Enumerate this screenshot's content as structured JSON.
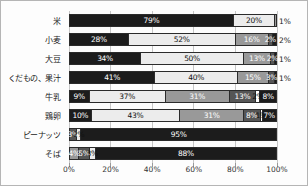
{
  "chart_data": {
    "type": "bar",
    "orientation": "horizontal-stacked",
    "title": "",
    "xlabel": "",
    "ylabel": "",
    "xlim": [
      0,
      100
    ],
    "grid": true,
    "x_ticks": [
      "0%",
      "20%",
      "40%",
      "60%",
      "80%",
      "100%"
    ],
    "categories": [
      "米",
      "小麦",
      "大豆",
      "くだもの、果汁",
      "牛乳",
      "鶏卵",
      "ピーナッツ",
      "そば"
    ],
    "colors": {
      "black": "#1c1c1c",
      "light": "#ececec",
      "gray": "#999999",
      "darkgray": "#555555",
      "white": "#ffffff",
      "text_dark": "#111111",
      "text_light": "#ffffff",
      "grid": "#c6c6c6",
      "border": "#2b2b2b"
    },
    "rows": [
      {
        "category": "米",
        "segments": [
          {
            "value": 79,
            "label": "79%",
            "color": "black"
          },
          {
            "value": 20,
            "label": "20%",
            "color": "light"
          },
          {
            "value": 1,
            "label": "",
            "color": "gray"
          }
        ],
        "outside_label": "1%"
      },
      {
        "category": "小麦",
        "segments": [
          {
            "value": 28,
            "label": "28%",
            "color": "black"
          },
          {
            "value": 52,
            "label": "52%",
            "color": "light"
          },
          {
            "value": 16,
            "label": "16%",
            "color": "gray"
          },
          {
            "value": 2,
            "label": "2%",
            "color": "darkgray"
          },
          {
            "value": 2,
            "label": "",
            "color": "black"
          }
        ],
        "outside_label": "2%"
      },
      {
        "category": "大豆",
        "segments": [
          {
            "value": 34,
            "label": "34%",
            "color": "black"
          },
          {
            "value": 50,
            "label": "50%",
            "color": "light"
          },
          {
            "value": 13,
            "label": "13%",
            "color": "gray"
          },
          {
            "value": 2,
            "label": "2%",
            "color": "darkgray"
          },
          {
            "value": 1,
            "label": "",
            "color": "black"
          }
        ],
        "outside_label": "1%"
      },
      {
        "category": "くだもの、果汁",
        "segments": [
          {
            "value": 41,
            "label": "41%",
            "color": "black"
          },
          {
            "value": 40,
            "label": "40%",
            "color": "light"
          },
          {
            "value": 15,
            "label": "15%",
            "color": "gray"
          },
          {
            "value": 3,
            "label": "3%",
            "color": "darkgray"
          },
          {
            "value": 1,
            "label": "",
            "color": "black"
          }
        ],
        "outside_label": "1%"
      },
      {
        "category": "牛乳",
        "segments": [
          {
            "value": 9,
            "label": "9%",
            "color": "black"
          },
          {
            "value": 37,
            "label": "37%",
            "color": "light"
          },
          {
            "value": 31,
            "label": "31%",
            "color": "gray"
          },
          {
            "value": 13,
            "label": "13%",
            "color": "darkgray"
          },
          {
            "value": 2,
            "label": "2%",
            "color": "white"
          },
          {
            "value": 8,
            "label": "8%",
            "color": "black"
          }
        ],
        "outside_label": ""
      },
      {
        "category": "鶏卵",
        "segments": [
          {
            "value": 10,
            "label": "10%",
            "color": "black"
          },
          {
            "value": 43,
            "label": "43%",
            "color": "light"
          },
          {
            "value": 31,
            "label": "31%",
            "color": "gray"
          },
          {
            "value": 8,
            "label": "8%",
            "color": "darkgray"
          },
          {
            "value": 1,
            "label": "1%",
            "color": "white"
          },
          {
            "value": 7,
            "label": "7%",
            "color": "black"
          }
        ],
        "outside_label": ""
      },
      {
        "category": "ピーナッツ",
        "segments": [
          {
            "value": 3,
            "label": "3%",
            "color": "darkgray"
          },
          {
            "value": 2,
            "label": "2%",
            "color": "light"
          },
          {
            "value": 95,
            "label": "95%",
            "color": "black"
          }
        ],
        "outside_label": ""
      },
      {
        "category": "そば",
        "segments": [
          {
            "value": 4,
            "label": "4%",
            "color": "gray"
          },
          {
            "value": 5,
            "label": "5%",
            "color": "darkgray"
          },
          {
            "value": 3,
            "label": "3%",
            "color": "light"
          },
          {
            "value": 88,
            "label": "88%",
            "color": "black"
          }
        ],
        "outside_label": ""
      }
    ],
    "layout": {
      "plot_left_px": 68,
      "plot_top_px": 10,
      "plot_width_px": 208,
      "plot_height_px": 152,
      "row_pitch_px": 19,
      "bar_height_px": 13,
      "bar_top_offset_px": 3,
      "x_label_top_px": 164
    }
  }
}
